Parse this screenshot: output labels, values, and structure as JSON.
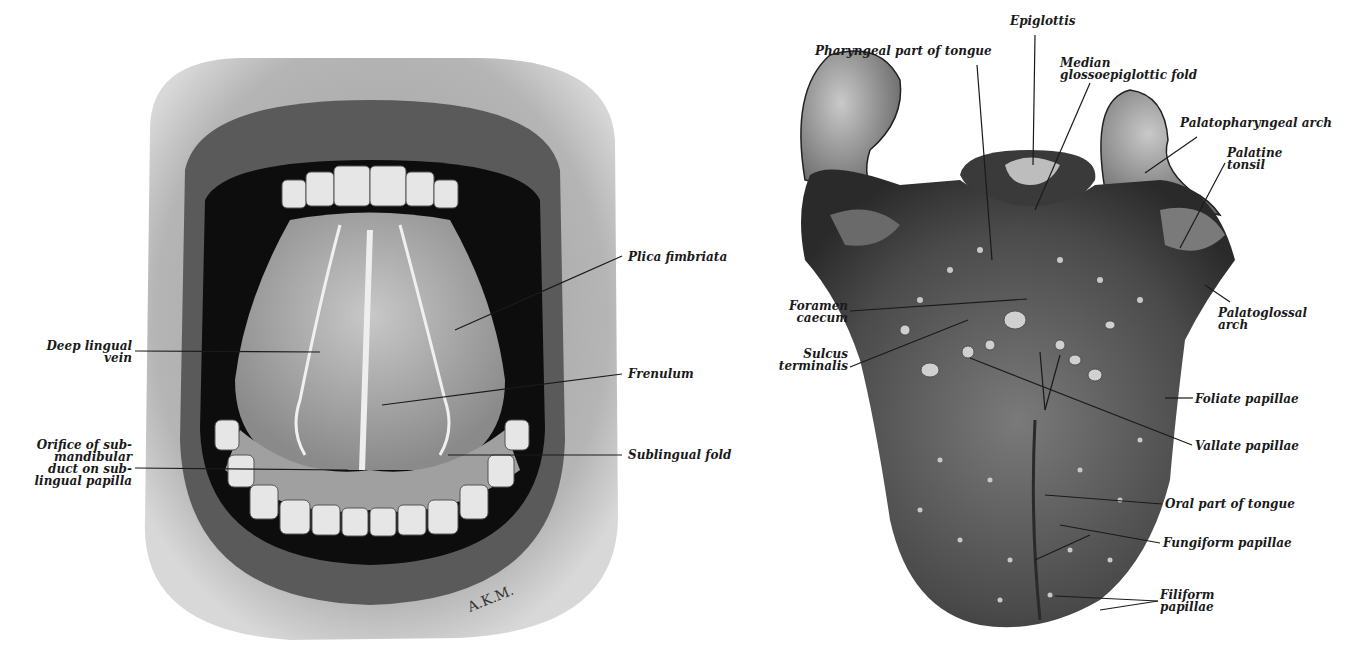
{
  "figure": {
    "left_panel": {
      "subject": "Open mouth showing inferior surface of tongue",
      "signature": "A.K.M.",
      "labels": {
        "deep_lingual_vein": "Deep lingual\nvein",
        "orifice_submandibular": "Orifice of sub-\nmandibular\nduct on sub-\nlingual papilla",
        "plica_fimbriata": "Plica fimbriata",
        "frenulum": "Frenulum",
        "sublingual_fold": "Sublingual fold"
      }
    },
    "right_panel": {
      "subject": "Dorsum of tongue",
      "labels": {
        "pharyngeal_part": "Pharyngeal part of tongue",
        "epiglottis": "Epiglottis",
        "median_fold": "Median\nglossoepiglottic fold",
        "palatopharyngeal_arch": "Palatopharyngeal arch",
        "palatine_tonsil": "Palatine\ntonsil",
        "foramen_caecum": "Foramen\ncaecum",
        "sulcus_terminalis": "Sulcus\nterminalis",
        "palatoglossal_arch": "Palatoglossal\narch",
        "foliate_papillae": "Foliate papillae",
        "vallate_papillae": "Vallate papillae",
        "oral_part": "Oral part of tongue",
        "fungiform_papillae": "Fungiform papillae",
        "filiform_papillae": "Filiform\npapillae"
      }
    }
  }
}
